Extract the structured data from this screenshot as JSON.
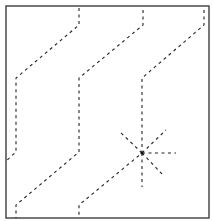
{
  "diagram": {
    "frame": {
      "x": 6,
      "y": 6,
      "width": 203,
      "height": 212,
      "stroke": "#555555",
      "stroke_width": 1.6
    },
    "line_style": {
      "stroke": "#222222",
      "stroke_width": 1.1,
      "dash": "3 3.5"
    },
    "paths": [
      {
        "name": "fold-path-left",
        "points": [
          [
            79,
            8
          ],
          [
            79,
            25
          ],
          [
            16,
            78
          ],
          [
            16,
            152
          ],
          [
            6,
            161
          ]
        ]
      },
      {
        "name": "fold-path-middle",
        "points": [
          [
            143,
            10
          ],
          [
            143,
            25
          ],
          [
            79,
            78
          ],
          [
            79,
            152
          ],
          [
            16,
            205
          ],
          [
            16,
            218
          ]
        ]
      },
      {
        "name": "fold-path-right",
        "points": [
          [
            204,
            10
          ],
          [
            204,
            25
          ],
          [
            142,
            78
          ],
          [
            142,
            153
          ],
          [
            79,
            205
          ],
          [
            79,
            218
          ]
        ]
      }
    ],
    "star": {
      "center": [
        142,
        153
      ],
      "rays": [
        [
          142,
          187
        ],
        [
          176,
          153
        ],
        [
          164,
          176
        ],
        [
          166,
          130
        ],
        [
          119,
          131
        ]
      ]
    }
  }
}
